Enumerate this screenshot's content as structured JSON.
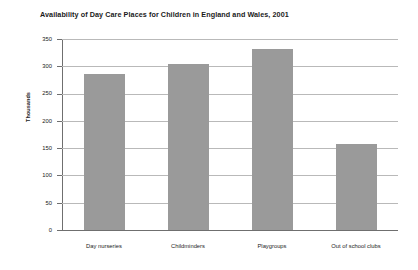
{
  "chart_data": {
    "type": "bar",
    "title": "Availability of Day Care Places for Children in England and Wales, 2001",
    "xlabel": "",
    "ylabel": "Thousands",
    "categories": [
      "Day nurseries",
      "Childminders",
      "Playgroups",
      "Out of school clubs"
    ],
    "values": [
      285,
      305,
      332,
      157
    ],
    "ylim": [
      0,
      350
    ],
    "ytick_labels": [
      "0",
      "50",
      "100",
      "150",
      "200",
      "250",
      "300",
      "350"
    ],
    "ytick_values": [
      0,
      50,
      100,
      150,
      200,
      250,
      300,
      350
    ],
    "grid": true,
    "legend": false,
    "bar_color": "#9a9a9a",
    "gridline_color": "#b9b9b9",
    "axis_color": "#6f6f6f",
    "text_color": "#1a1a1a",
    "background": "#ffffff"
  }
}
